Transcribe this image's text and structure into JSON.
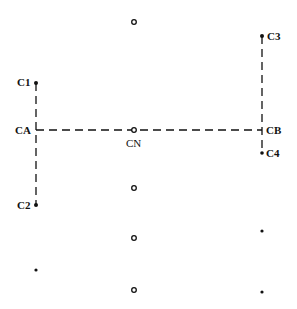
{
  "diagram": {
    "labels": {
      "c1": "C1",
      "c2": "C2",
      "ca": "CA",
      "cn": "CN",
      "cb": "CB",
      "c3": "C3",
      "c4": "C4"
    },
    "nodes": [
      {
        "id": "C1",
        "type": "filled-dot",
        "x": 36,
        "y": 83
      },
      {
        "id": "CA",
        "type": "junction",
        "x": 36,
        "y": 130
      },
      {
        "id": "C2",
        "type": "filled-dot",
        "x": 36,
        "y": 205
      },
      {
        "id": "CN",
        "type": "open-circle",
        "x": 134,
        "y": 130
      },
      {
        "id": "CB",
        "type": "junction",
        "x": 262,
        "y": 130
      },
      {
        "id": "C3",
        "type": "filled-dot",
        "x": 262,
        "y": 36
      },
      {
        "id": "C4",
        "type": "filled-dot",
        "x": 262,
        "y": 153
      }
    ],
    "unlabeled_points": [
      {
        "type": "open-circle",
        "x": 134,
        "y": 22
      },
      {
        "type": "open-circle",
        "x": 134,
        "y": 188
      },
      {
        "type": "open-circle",
        "x": 134,
        "y": 238
      },
      {
        "type": "open-circle",
        "x": 134,
        "y": 290
      },
      {
        "type": "filled-dot",
        "x": 36,
        "y": 270
      },
      {
        "type": "filled-dot",
        "x": 262,
        "y": 231
      },
      {
        "type": "filled-dot",
        "x": 262,
        "y": 292
      }
    ],
    "edges": [
      {
        "from": "CA",
        "to": "CB",
        "style": "dashed"
      },
      {
        "from": "C1",
        "to": "C2",
        "style": "dashed"
      },
      {
        "from": "C3",
        "to": "C4",
        "style": "dashed"
      }
    ],
    "colors": {
      "ink": "#111111",
      "background": "#ffffff"
    }
  }
}
